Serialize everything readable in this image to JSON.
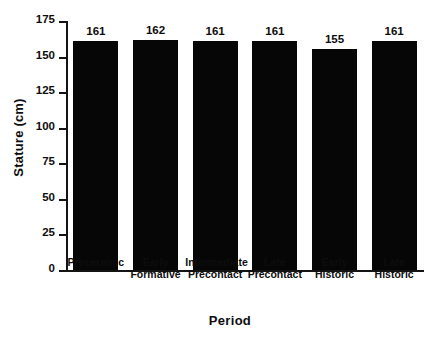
{
  "chart_data": {
    "type": "bar",
    "title": "",
    "subtitle": "",
    "xlabel": "Period",
    "ylabel": "Stature (cm)",
    "categories": [
      "Preceramic",
      "Early Formative",
      "Intermediate Precontact",
      "Late Precontact",
      "Early Historic",
      "Late Historic"
    ],
    "values": [
      161,
      162,
      161,
      161,
      155,
      161
    ],
    "data_labels": [
      "161",
      "162",
      "161",
      "161",
      "155",
      "161"
    ],
    "ylim": [
      0,
      175
    ],
    "ytick_values": [
      0,
      25,
      50,
      75,
      100,
      125,
      150,
      175
    ],
    "ytick_labels": [
      "0",
      "25",
      "50",
      "75",
      "100",
      "125",
      "150",
      "175"
    ],
    "grid": false,
    "legend": null,
    "legend_position": "none",
    "bar_color": "#060606",
    "axis_color": "#141414",
    "background_color": "#ffffff",
    "annotations": []
  },
  "axis": {
    "y_title": "Stature (cm)",
    "x_title": "Period"
  },
  "ticks": [
    {
      "label": "175",
      "value": 175
    },
    {
      "label": "150",
      "value": 150
    },
    {
      "label": "125",
      "value": 125
    },
    {
      "label": "100",
      "value": 100
    },
    {
      "label": "75",
      "value": 75
    },
    {
      "label": "50",
      "value": 50
    },
    {
      "label": "25",
      "value": 25
    },
    {
      "label": "0",
      "value": 0
    }
  ],
  "bars": [
    {
      "label": "Preceramic",
      "label_line1": "Preceramic",
      "label_line2": "",
      "value": 161,
      "value_label": "161"
    },
    {
      "label": "Early Formative",
      "label_line1": "Early",
      "label_line2": "Formative",
      "value": 162,
      "value_label": "162"
    },
    {
      "label": "Intermediate Precontact",
      "label_line1": "Intermediate",
      "label_line2": "Precontact",
      "value": 161,
      "value_label": "161"
    },
    {
      "label": "Late Precontact",
      "label_line1": "Late",
      "label_line2": "Precontact",
      "value": 161,
      "value_label": "161"
    },
    {
      "label": "Early Historic",
      "label_line1": "Early",
      "label_line2": "Historic",
      "value": 155,
      "value_label": "155"
    },
    {
      "label": "Late Historic",
      "label_line1": "Late",
      "label_line2": "Historic",
      "value": 161,
      "value_label": "161"
    }
  ]
}
